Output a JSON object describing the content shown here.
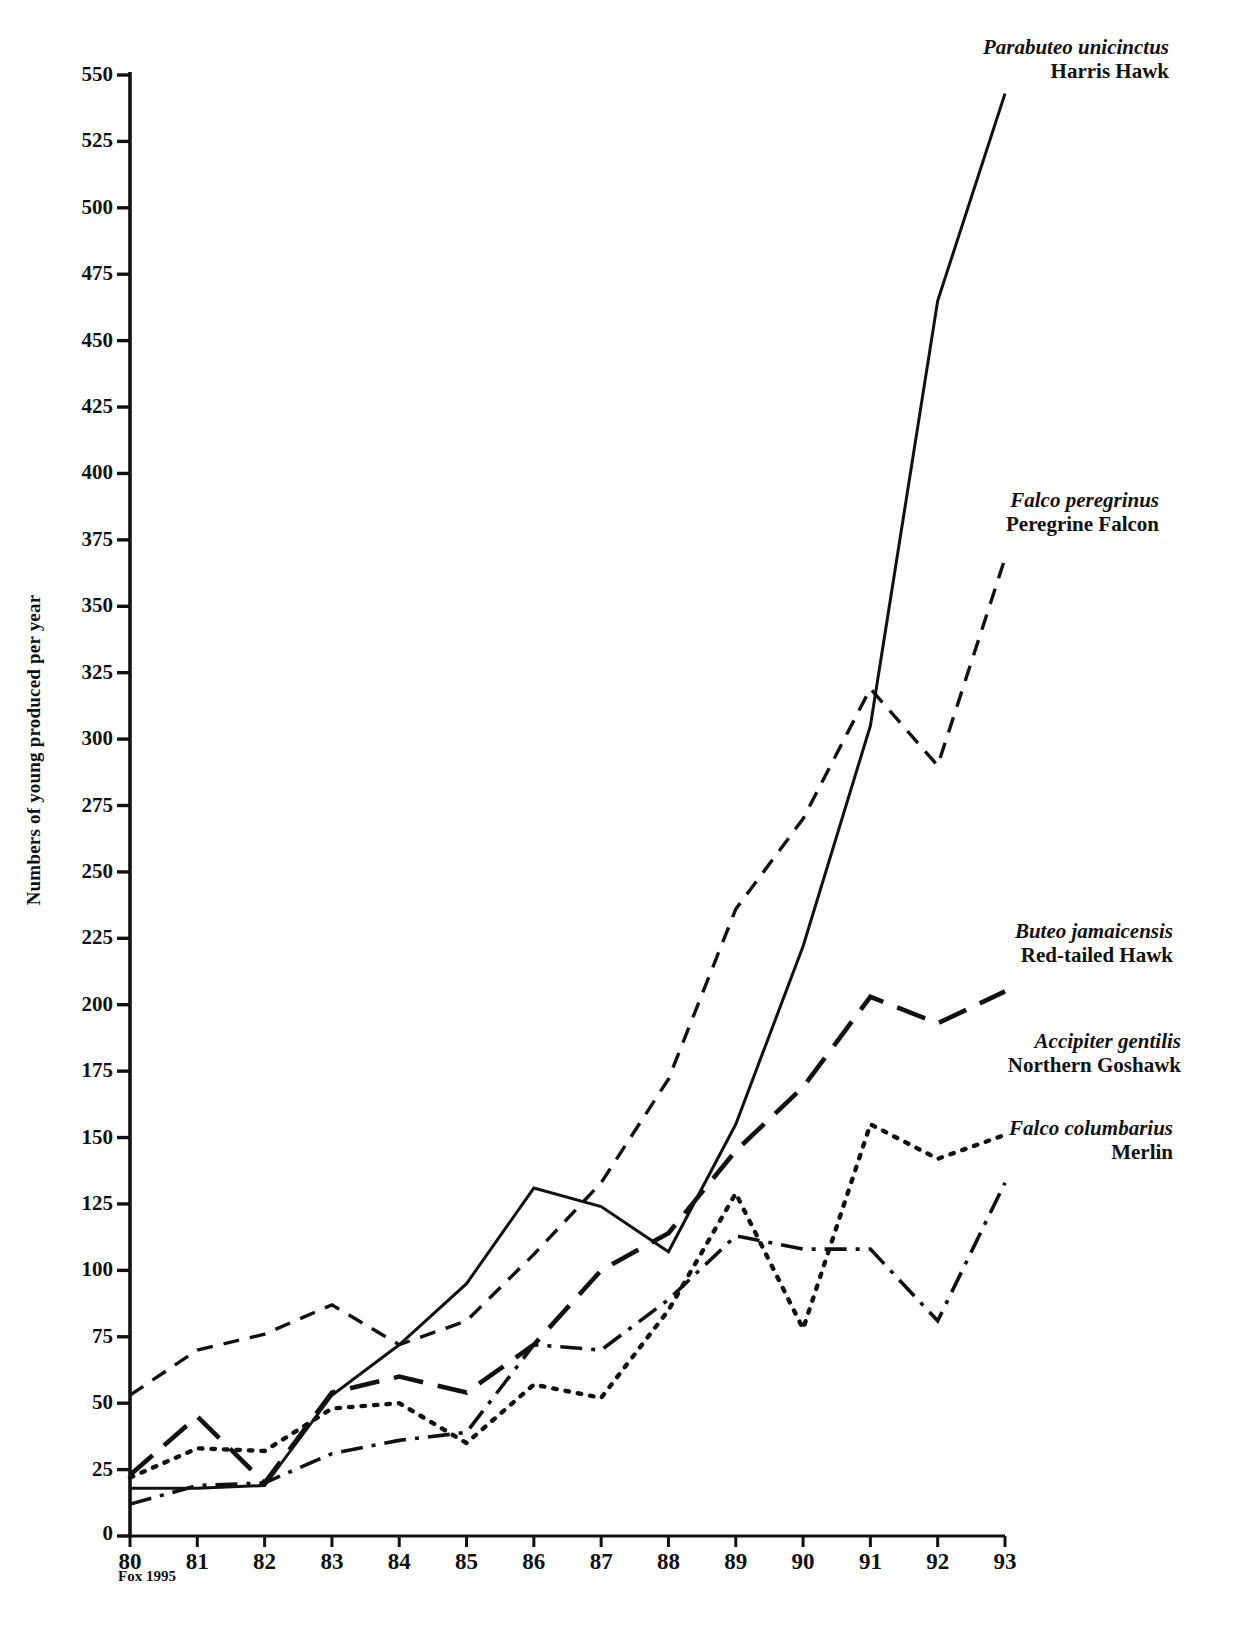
{
  "figure": {
    "source_note": "Fox 1995",
    "background": "#ffffff",
    "ink": "#111111"
  },
  "axes": {
    "ylabel": "Numbers of young produced per year",
    "yticks": [
      0,
      25,
      50,
      75,
      100,
      125,
      150,
      175,
      200,
      225,
      250,
      275,
      300,
      325,
      350,
      375,
      400,
      425,
      450,
      475,
      500,
      525,
      550
    ],
    "ytick_labels": [
      "0",
      "25",
      "50",
      "75",
      "100",
      "125",
      "150",
      "175",
      "200",
      "225",
      "250",
      "275",
      "300",
      "325",
      "350",
      "375",
      "400",
      "425",
      "450",
      "475",
      "500",
      "525",
      "550"
    ],
    "xticks": [
      80,
      81,
      82,
      83,
      84,
      85,
      86,
      87,
      88,
      89,
      90,
      91,
      92,
      93
    ],
    "xtick_labels": [
      "80",
      "81",
      "82",
      "83",
      "84",
      "85",
      "86",
      "87",
      "88",
      "89",
      "90",
      "91",
      "92",
      "93"
    ],
    "xlabel": ""
  },
  "chart_data": {
    "type": "line",
    "title": "",
    "xlabel": "",
    "ylabel": "Numbers of young produced per year",
    "xlim": [
      80,
      93
    ],
    "ylim": [
      0,
      550
    ],
    "grid": false,
    "legend_position": "right-inline-annotations",
    "x": [
      80,
      81,
      82,
      83,
      84,
      85,
      86,
      87,
      88,
      89,
      90,
      91,
      92,
      93
    ],
    "series": [
      {
        "name": "Harris Hawk",
        "scientific_name": "Parabuteo unicinctus",
        "common_name": "Harris Hawk",
        "line_style": "solid",
        "values": [
          18,
          18,
          19,
          53,
          72,
          95,
          131,
          124,
          107,
          155,
          222,
          305,
          465,
          543
        ]
      },
      {
        "name": "Peregrine Falcon",
        "scientific_name": "Falco peregrinus",
        "common_name": "Peregrine Falcon",
        "line_style": "dashed-short",
        "values": [
          53,
          70,
          76,
          87,
          72,
          81,
          106,
          133,
          172,
          236,
          270,
          319,
          290,
          368
        ]
      },
      {
        "name": "Red-tailed Hawk",
        "scientific_name": "Buteo jamaicensis",
        "common_name": "Red-tailed Hawk",
        "line_style": "dashed-long",
        "values": [
          23,
          45,
          20,
          54,
          60,
          54,
          72,
          100,
          114,
          145,
          169,
          203,
          193,
          205
        ]
      },
      {
        "name": "Northern Goshawk",
        "scientific_name": "Accipiter gentilis",
        "common_name": "Northern Goshawk",
        "line_style": "dotted",
        "values": [
          22,
          33,
          32,
          48,
          50,
          35,
          57,
          52,
          85,
          129,
          78,
          155,
          142,
          151
        ]
      },
      {
        "name": "Merlin",
        "scientific_name": "Falco columbarius",
        "common_name": "Merlin",
        "line_style": "dash-dot",
        "values": [
          12,
          19,
          20,
          31,
          36,
          39,
          72,
          70,
          89,
          113,
          108,
          108,
          81,
          133
        ]
      }
    ]
  },
  "annotations": [
    {
      "id": "harris-hawk",
      "scientific_name": "Parabuteo unicinctus",
      "common_name": "Harris Hawk"
    },
    {
      "id": "peregrine-falcon",
      "scientific_name": "Falco peregrinus",
      "common_name": "Peregrine Falcon"
    },
    {
      "id": "red-tailed-hawk",
      "scientific_name": "Buteo jamaicensis",
      "common_name": "Red-tailed Hawk"
    },
    {
      "id": "northern-goshawk",
      "scientific_name": "Accipiter gentilis",
      "common_name": "Northern Goshawk"
    },
    {
      "id": "merlin",
      "scientific_name": "Falco columbarius",
      "common_name": "Merlin"
    }
  ]
}
